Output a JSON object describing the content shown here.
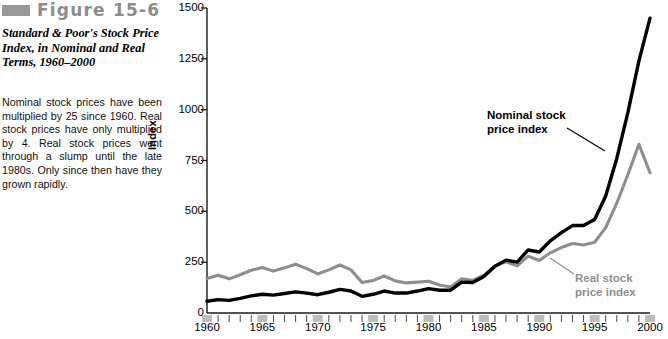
{
  "figure": {
    "swatch_color": "#9a9a9a",
    "label": "Figure 15-6",
    "title": "Standard & Poor's Stock Price Index, in Nominal and Real Terms, 1960–2000",
    "description": "Nominal stock prices have been multiplied by 25 since 1960. Real stock prices have only multiplied by 4. Real stock prices went through a slump until the late 1980s. Only since then have they grown rapidly."
  },
  "colors": {
    "nominal_line": "#000000",
    "real_line": "#8e8e8e",
    "axis": "#1a1a1a",
    "tick_band": "#bdbdbd",
    "figure_label": "#8d8d8d"
  },
  "chart_data": {
    "type": "line",
    "title": "Standard & Poor's Stock Price Index, in Nominal and Real Terms, 1960–2000",
    "xlabel": "",
    "ylabel": "Index",
    "xlim": [
      1960,
      2000
    ],
    "ylim": [
      0,
      1500
    ],
    "yticks": [
      0,
      250,
      500,
      750,
      1000,
      1250,
      1500
    ],
    "xticks": [
      1960,
      1965,
      1970,
      1975,
      1980,
      1985,
      1990,
      1995,
      2000
    ],
    "xtick_labels": [
      "1960",
      "1965",
      "1970",
      "1975",
      "1980",
      "1985",
      "1990",
      "1995",
      "2000"
    ],
    "ytick_labels": [
      "0",
      "250",
      "500",
      "750",
      "1000",
      "1250",
      "1500"
    ],
    "grid": false,
    "legend": "inline-annotations",
    "x": [
      1960,
      1961,
      1962,
      1963,
      1964,
      1965,
      1966,
      1967,
      1968,
      1969,
      1970,
      1971,
      1972,
      1973,
      1974,
      1975,
      1976,
      1977,
      1978,
      1979,
      1980,
      1981,
      1982,
      1983,
      1984,
      1985,
      1986,
      1987,
      1988,
      1989,
      1990,
      1991,
      1992,
      1993,
      1994,
      1995,
      1996,
      1997,
      1998,
      1999,
      2000
    ],
    "series": [
      {
        "name": "Nominal stock price index",
        "color": "#000000",
        "values": [
          58,
          66,
          62,
          72,
          84,
          92,
          88,
          96,
          104,
          98,
          90,
          102,
          116,
          108,
          82,
          92,
          108,
          98,
          98,
          108,
          120,
          112,
          112,
          152,
          150,
          180,
          230,
          260,
          250,
          310,
          300,
          355,
          395,
          430,
          430,
          460,
          575,
          760,
          985,
          1240,
          1450
        ]
      },
      {
        "name": "Real stock price index",
        "color": "#8e8e8e",
        "values": [
          170,
          186,
          168,
          188,
          210,
          224,
          206,
          222,
          240,
          218,
          192,
          212,
          236,
          212,
          150,
          160,
          182,
          158,
          148,
          152,
          156,
          138,
          128,
          168,
          160,
          186,
          232,
          252,
          232,
          280,
          258,
          296,
          322,
          342,
          334,
          348,
          420,
          540,
          680,
          830,
          690
        ]
      }
    ],
    "annotations": [
      {
        "text": "Nominal stock price index",
        "series": "Nominal stock price index",
        "color": "#000000"
      },
      {
        "text": "Real stock price index",
        "series": "Real stock price index",
        "color": "#8e8e8e"
      }
    ]
  },
  "labels": {
    "nominal_line1": "Nominal stock",
    "nominal_line2": "price index",
    "real_line1": "Real stock",
    "real_line2": "price index"
  }
}
